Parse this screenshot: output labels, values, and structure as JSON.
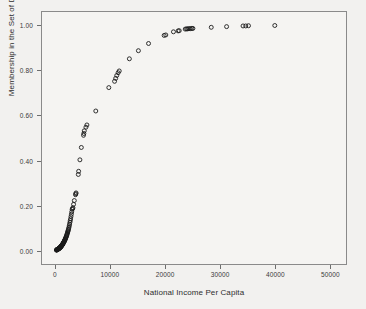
{
  "chart_data": {
    "type": "scatter",
    "title": "",
    "xlabel": "National Income Per Capita",
    "ylabel": "Membership in the Set of Developed Countries",
    "xlim": [
      -2500,
      53000
    ],
    "ylim": [
      -0.06,
      1.06
    ],
    "xticks": [
      0,
      10000,
      20000,
      30000,
      40000,
      50000
    ],
    "xtick_labels": [
      "0",
      "10000",
      "20000",
      "30000",
      "40000",
      "50000"
    ],
    "yticks": [
      0.0,
      0.2,
      0.4,
      0.6,
      0.8,
      1.0
    ],
    "ytick_labels": [
      "0.00",
      "0.20",
      "0.40",
      "0.60",
      "0.80",
      "1.00"
    ],
    "grid": false,
    "legend": null,
    "marker": "open-circle",
    "marker_size": 4,
    "marker_color": "#1a1a1a",
    "frame_color": "#8a8a8a",
    "background_color": "#f2f1ef",
    "series": [
      {
        "name": "Countries",
        "points": [
          [
            120,
            0.002
          ],
          [
            160,
            0.002
          ],
          [
            185,
            0.003
          ],
          [
            210,
            0.003
          ],
          [
            235,
            0.003
          ],
          [
            260,
            0.004
          ],
          [
            285,
            0.004
          ],
          [
            305,
            0.004
          ],
          [
            330,
            0.005
          ],
          [
            355,
            0.005
          ],
          [
            380,
            0.005
          ],
          [
            405,
            0.006
          ],
          [
            430,
            0.006
          ],
          [
            455,
            0.006
          ],
          [
            480,
            0.007
          ],
          [
            505,
            0.007
          ],
          [
            530,
            0.008
          ],
          [
            555,
            0.008
          ],
          [
            580,
            0.009
          ],
          [
            605,
            0.009
          ],
          [
            630,
            0.01
          ],
          [
            655,
            0.01
          ],
          [
            680,
            0.011
          ],
          [
            705,
            0.011
          ],
          [
            730,
            0.012
          ],
          [
            755,
            0.012
          ],
          [
            780,
            0.013
          ],
          [
            805,
            0.013
          ],
          [
            830,
            0.014
          ],
          [
            855,
            0.015
          ],
          [
            880,
            0.015
          ],
          [
            905,
            0.016
          ],
          [
            930,
            0.017
          ],
          [
            955,
            0.017
          ],
          [
            980,
            0.018
          ],
          [
            1010,
            0.019
          ],
          [
            1040,
            0.02
          ],
          [
            1070,
            0.021
          ],
          [
            1100,
            0.022
          ],
          [
            1130,
            0.023
          ],
          [
            1160,
            0.024
          ],
          [
            1190,
            0.025
          ],
          [
            1220,
            0.026
          ],
          [
            1250,
            0.027
          ],
          [
            1285,
            0.029
          ],
          [
            1320,
            0.03
          ],
          [
            1355,
            0.032
          ],
          [
            1390,
            0.033
          ],
          [
            1425,
            0.035
          ],
          [
            1460,
            0.036
          ],
          [
            1500,
            0.038
          ],
          [
            1540,
            0.04
          ],
          [
            1580,
            0.042
          ],
          [
            1620,
            0.044
          ],
          [
            1660,
            0.046
          ],
          [
            1700,
            0.048
          ],
          [
            1745,
            0.051
          ],
          [
            1790,
            0.053
          ],
          [
            1835,
            0.056
          ],
          [
            1880,
            0.058
          ],
          [
            1930,
            0.062
          ],
          [
            1975,
            0.065
          ],
          [
            2020,
            0.068
          ],
          [
            2070,
            0.072
          ],
          [
            2120,
            0.076
          ],
          [
            2170,
            0.08
          ],
          [
            2215,
            0.084
          ],
          [
            2260,
            0.088
          ],
          [
            2310,
            0.092
          ],
          [
            2360,
            0.097
          ],
          [
            2420,
            0.103
          ],
          [
            2480,
            0.11
          ],
          [
            2540,
            0.117
          ],
          [
            2600,
            0.125
          ],
          [
            2660,
            0.133
          ],
          [
            2720,
            0.141
          ],
          [
            2790,
            0.151
          ],
          [
            2860,
            0.161
          ],
          [
            2930,
            0.172
          ],
          [
            3000,
            0.183
          ],
          [
            3080,
            0.186
          ],
          [
            3150,
            0.19
          ],
          [
            3260,
            0.205
          ],
          [
            3400,
            0.222
          ],
          [
            3620,
            0.248
          ],
          [
            3680,
            0.252
          ],
          [
            3720,
            0.256
          ],
          [
            4130,
            0.338
          ],
          [
            4190,
            0.352
          ],
          [
            4420,
            0.403
          ],
          [
            4680,
            0.458
          ],
          [
            5080,
            0.512
          ],
          [
            5140,
            0.52
          ],
          [
            5220,
            0.532
          ],
          [
            5520,
            0.548
          ],
          [
            5700,
            0.558
          ],
          [
            7320,
            0.62
          ],
          [
            9700,
            0.724
          ],
          [
            10750,
            0.752
          ],
          [
            10950,
            0.765
          ],
          [
            11150,
            0.778
          ],
          [
            11400,
            0.79
          ],
          [
            11600,
            0.798
          ],
          [
            13450,
            0.852
          ],
          [
            15100,
            0.888
          ],
          [
            16950,
            0.92
          ],
          [
            19800,
            0.956
          ],
          [
            20100,
            0.958
          ],
          [
            21500,
            0.972
          ],
          [
            22350,
            0.976
          ],
          [
            22550,
            0.977
          ],
          [
            23650,
            0.984
          ],
          [
            23900,
            0.985
          ],
          [
            24100,
            0.985
          ],
          [
            24350,
            0.986
          ],
          [
            24600,
            0.986
          ],
          [
            24850,
            0.987
          ],
          [
            25050,
            0.987
          ],
          [
            28400,
            0.992
          ],
          [
            31200,
            0.995
          ],
          [
            34200,
            0.998
          ],
          [
            34700,
            0.998
          ],
          [
            35200,
            0.999
          ],
          [
            40000,
            1.0
          ]
        ]
      }
    ]
  },
  "axes": {
    "x_title": "National Income Per Capita",
    "y_title": "Membership in the Set of Developed Countries"
  }
}
